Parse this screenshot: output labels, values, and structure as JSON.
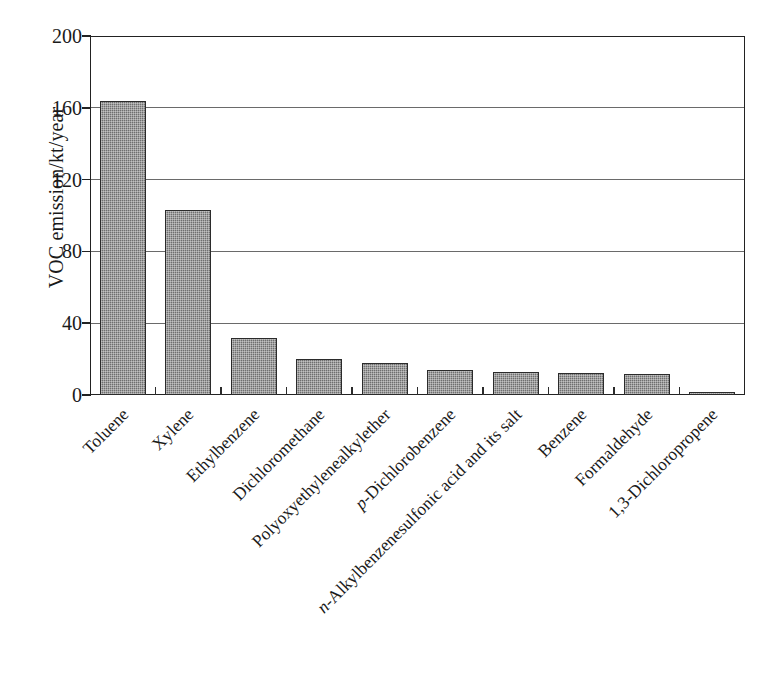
{
  "chart_data": {
    "type": "bar",
    "title": "",
    "xlabel": "",
    "ylabel": "VOC emission/kt/year",
    "ylim": [
      0,
      200
    ],
    "yticks": [
      0,
      40,
      80,
      120,
      160,
      200
    ],
    "ytick_labels": [
      "0",
      "40",
      "80",
      "120",
      "160",
      "200"
    ],
    "grid": true,
    "legend": "none",
    "bar_color": "#6f6f6f",
    "bar_edge_color": "#2b2b2b",
    "axis_color": "#222222",
    "categories": [
      "Toluene",
      "Xylene",
      "Ethylbenzene",
      "Dichloromethane",
      "Polyoxyethylenealkylether",
      "p-Dichlorobenzene",
      "n-Alkylbenzenesulfonic acid and its salt",
      "Benzene",
      "Formaldehyde",
      "1,3-Dichloropropene"
    ],
    "category_labels_html": [
      "Toluene",
      "Xylene",
      "Ethylbenzene",
      "Dichloromethane",
      "Polyoxyethylenealkylether",
      "<i>p</i>-Dichlorobenzene",
      "<i>n</i>-Alkylbenzenesulfonic acid and its salt",
      "Benzene",
      "Formaldehyde",
      "1,3-Dichloropropene"
    ],
    "values": [
      164,
      103,
      32,
      20,
      18,
      14,
      13,
      12,
      11.5,
      1
    ]
  }
}
